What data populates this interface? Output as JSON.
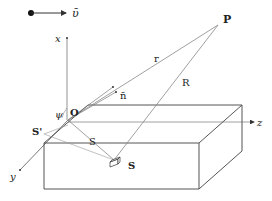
{
  "diagram": {
    "velocity_label": "ῡ",
    "axes": {
      "x": "x",
      "y": "y",
      "z": "z"
    },
    "points": {
      "origin": "O",
      "observer": "P",
      "source": "S",
      "source_projection": "S'"
    },
    "vectors": {
      "normal": "n̄"
    },
    "distances": {
      "origin_to_P": "r",
      "source_to_P": "R",
      "origin_to_source": "S"
    },
    "angle": "ψ"
  }
}
